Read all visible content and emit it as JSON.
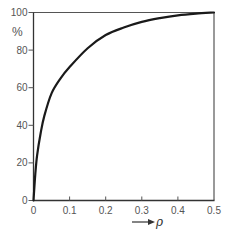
{
  "chart_data": {
    "type": "line",
    "title": "",
    "xlabel": "ρ",
    "xlabel_prefix_arrow": "→",
    "ylabel": "%",
    "xlim": [
      0,
      0.5
    ],
    "ylim": [
      0,
      100
    ],
    "grid": false,
    "legend": null,
    "x_ticks": [
      0,
      0.1,
      0.2,
      0.3,
      0.4,
      0.5
    ],
    "x_tick_labels": [
      "0",
      "0.1",
      "0.2",
      "0.3",
      "0.4",
      "0.5"
    ],
    "y_ticks": [
      0,
      20,
      40,
      60,
      80,
      100
    ],
    "y_tick_labels": [
      "0",
      "20",
      "40",
      "60",
      "80",
      "100"
    ],
    "series": [
      {
        "name": "curve",
        "color": "#1a1a1a",
        "x": [
          0,
          0.005,
          0.01,
          0.02,
          0.03,
          0.05,
          0.075,
          0.1,
          0.15,
          0.2,
          0.25,
          0.3,
          0.35,
          0.4,
          0.45,
          0.5
        ],
        "y": [
          0,
          14,
          24,
          36,
          45,
          57,
          65,
          71,
          81,
          88,
          92,
          95,
          97,
          98.5,
          99.4,
          100
        ]
      }
    ]
  },
  "colors": {
    "axis": "#333333",
    "frame": "#555555",
    "curve": "#1a1a1a",
    "text": "#555555"
  }
}
